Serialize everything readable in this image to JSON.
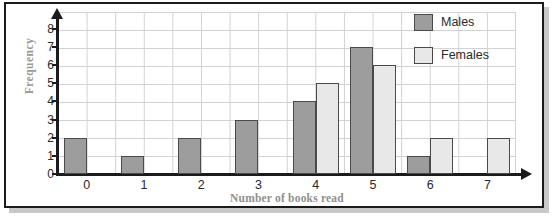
{
  "chart_data": {
    "type": "bar",
    "title": "",
    "xlabel": "Number of books read",
    "ylabel": "Frequency",
    "categories": [
      "0",
      "1",
      "2",
      "3",
      "4",
      "5",
      "6",
      "7"
    ],
    "series": [
      {
        "name": "Males",
        "color": "#9d9d9d",
        "values": [
          2,
          1,
          2,
          3,
          4,
          7,
          1,
          0
        ]
      },
      {
        "name": "Females",
        "color": "#e8e8e8",
        "values": [
          0,
          0,
          0,
          0,
          5,
          6,
          2,
          2
        ]
      }
    ],
    "yticks": [
      "0",
      "1",
      "2",
      "3",
      "4",
      "5",
      "6",
      "7",
      "8"
    ],
    "ylim": [
      0,
      8.6
    ],
    "grid": true,
    "legend_position": "top-right",
    "legend": [
      "Males",
      "Females"
    ]
  },
  "axis": {
    "y_title": "Frequency",
    "x_title": "Number of books read"
  },
  "legend": {
    "rows": [
      {
        "label": "Males",
        "swatch": "males-swatch"
      },
      {
        "label": "Females",
        "swatch": "females-swatch"
      }
    ]
  },
  "colors": {
    "males": "#9d9d9d",
    "females": "#e8e8e8",
    "grid": "#d2d2d2",
    "axis": "#1b1b1b",
    "frame": "#1b1b1b",
    "label_gray": "#9a9a9a"
  }
}
